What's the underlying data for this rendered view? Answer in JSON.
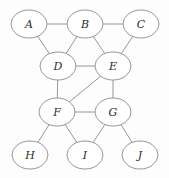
{
  "figure": {
    "background_color": "#fdfdfd",
    "node_fill_color": "#ffffff",
    "stroke_color": "#8a8a8a",
    "label_color": "#2a2a2a",
    "width": 169,
    "height": 178
  },
  "chart_data": {
    "type": "diagram",
    "title": "",
    "xlabel": "",
    "ylabel": "",
    "grid": false,
    "legend": null,
    "graph_type": "undirected",
    "node_shape": "ellipse",
    "node_rx": 18,
    "node_ry": 14,
    "nodes": [
      {
        "id": "A",
        "label": "A",
        "x": 29,
        "y": 24
      },
      {
        "id": "B",
        "label": "B",
        "x": 85,
        "y": 24
      },
      {
        "id": "C",
        "label": "C",
        "x": 141,
        "y": 24
      },
      {
        "id": "D",
        "label": "D",
        "x": 58,
        "y": 66
      },
      {
        "id": "E",
        "label": "E",
        "x": 113,
        "y": 66
      },
      {
        "id": "F",
        "label": "F",
        "x": 57,
        "y": 112
      },
      {
        "id": "G",
        "label": "G",
        "x": 113,
        "y": 112
      },
      {
        "id": "H",
        "label": "H",
        "x": 30,
        "y": 155
      },
      {
        "id": "I",
        "label": "I",
        "x": 85,
        "y": 155
      },
      {
        "id": "J",
        "label": "J",
        "x": 140,
        "y": 155
      }
    ],
    "edges": [
      {
        "from": "A",
        "to": "B"
      },
      {
        "from": "B",
        "to": "C"
      },
      {
        "from": "A",
        "to": "D"
      },
      {
        "from": "B",
        "to": "D"
      },
      {
        "from": "B",
        "to": "E"
      },
      {
        "from": "C",
        "to": "E"
      },
      {
        "from": "D",
        "to": "E"
      },
      {
        "from": "D",
        "to": "F"
      },
      {
        "from": "E",
        "to": "F"
      },
      {
        "from": "E",
        "to": "G"
      },
      {
        "from": "F",
        "to": "G"
      },
      {
        "from": "F",
        "to": "H"
      },
      {
        "from": "F",
        "to": "I"
      },
      {
        "from": "G",
        "to": "I"
      },
      {
        "from": "G",
        "to": "J"
      }
    ],
    "node_count": 10,
    "edge_count": 15
  }
}
